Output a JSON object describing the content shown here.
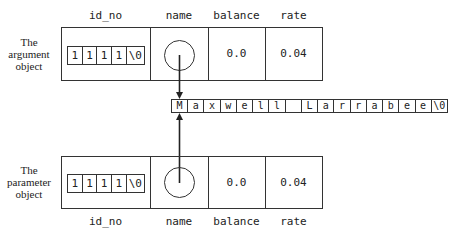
{
  "columns": [
    "id_no",
    "name",
    "balance",
    "rate"
  ],
  "argument_object": {
    "label_lines": [
      "The",
      "argument",
      "object"
    ],
    "id_no": [
      "1",
      "1",
      "1",
      "1",
      "\\0"
    ],
    "balance": "0.0",
    "rate": "0.04"
  },
  "parameter_object": {
    "label_lines": [
      "The",
      "parameter",
      "object"
    ],
    "id_no": [
      "1",
      "1",
      "1",
      "1",
      "\\0"
    ],
    "balance": "0.0",
    "rate": "0.04"
  },
  "name_string": {
    "text": "Maxwell Larrabee\\0",
    "cells": [
      "M",
      "a",
      "x",
      "w",
      "e",
      "l",
      "l",
      " ",
      "L",
      "a",
      "r",
      "r",
      "a",
      "b",
      "e",
      "e",
      "\\0"
    ]
  },
  "colors": {
    "line": "#333333",
    "text": "#222222",
    "background": "#ffffff"
  }
}
